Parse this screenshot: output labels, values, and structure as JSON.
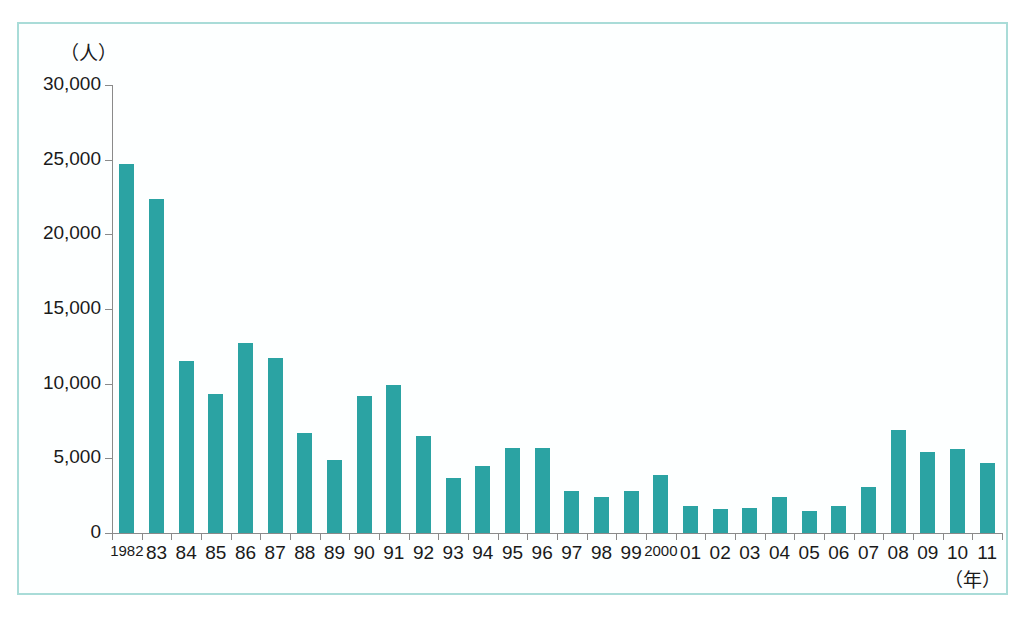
{
  "chart_data": {
    "type": "bar",
    "title": "",
    "subtitle": "",
    "xlabel": "（年）",
    "ylabel": "（人）",
    "ylim": [
      0,
      30000
    ],
    "ytick_values": [
      30000,
      25000,
      20000,
      15000,
      10000,
      5000,
      0
    ],
    "ytick_labels": [
      "30,000",
      "25,000",
      "20,000",
      "15,000",
      "10,000",
      "5,000",
      "0"
    ],
    "grid": false,
    "legend": null,
    "categories": [
      "1982",
      "83",
      "84",
      "85",
      "86",
      "87",
      "88",
      "89",
      "90",
      "91",
      "92",
      "93",
      "94",
      "95",
      "96",
      "97",
      "98",
      "99",
      "2000",
      "01",
      "02",
      "03",
      "04",
      "05",
      "06",
      "07",
      "08",
      "09",
      "10",
      "11"
    ],
    "values": [
      24700,
      22400,
      11500,
      9300,
      12700,
      11700,
      6700,
      4900,
      9200,
      9900,
      6500,
      3700,
      4500,
      5700,
      5700,
      2800,
      2400,
      2800,
      3900,
      1800,
      1600,
      1700,
      2400,
      1500,
      1800,
      3100,
      6900,
      5400,
      5600,
      4700
    ],
    "bar_color": "#2ba3a3",
    "frame_color": "#a9dcd8",
    "axis_color": "#8a8a8a",
    "background_color": "#ffffff"
  }
}
